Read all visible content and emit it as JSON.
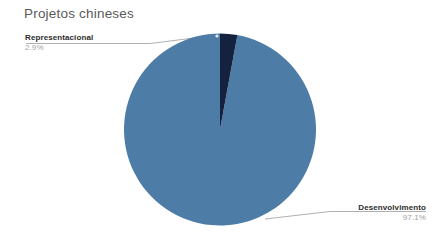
{
  "chart_data": {
    "type": "pie",
    "title": "Projetos chineses",
    "categories": [
      "Desenvolvimento",
      "Representacional"
    ],
    "values": [
      97.1,
      2.9
    ],
    "value_labels": [
      "97.1%",
      "2.9%"
    ],
    "colors": [
      "#4d7da6",
      "#14223f"
    ],
    "unit": "percent",
    "start_angle_deg": 0,
    "direction": "counterclockwise",
    "legend": "none",
    "labels_position": "outside-with-leader-lines",
    "grid": false,
    "xlabel": "",
    "ylabel": ""
  },
  "header": {
    "title": "Projetos chineses"
  },
  "callouts": {
    "representacional": {
      "name": "Representacional",
      "percent": "2.9%"
    },
    "desenvolvimento": {
      "name": "Desenvolvimento",
      "percent": "97.1%"
    }
  },
  "colors": {
    "slice_primary": "#4d7da6",
    "slice_secondary": "#14223f",
    "title_text": "#5a5a5a",
    "label_text": "#2d2d2d",
    "percent_text": "#a2a2a2",
    "leader_line": "#8d8d8d",
    "background": "#ffffff"
  }
}
